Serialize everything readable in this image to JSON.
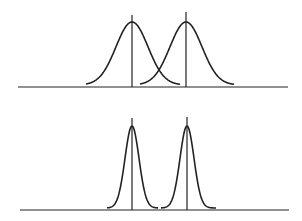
{
  "diagram": {
    "panels": [
      {
        "name": "top",
        "label": "",
        "baseline_y": 87,
        "axis_x": [
          18,
          288
        ],
        "curves": [
          {
            "mean_x": 132,
            "peak_y": 22,
            "sigma_px": 16,
            "span": [
              86,
              180
            ],
            "mean_line_top": 15
          },
          {
            "mean_x": 186,
            "peak_y": 22,
            "sigma_px": 16,
            "span": [
              140,
              234
            ],
            "mean_line_top": 12
          }
        ]
      },
      {
        "name": "bottom",
        "label": "",
        "baseline_y": 210,
        "axis_x": [
          20,
          289
        ],
        "curves": [
          {
            "mean_x": 132,
            "peak_y": 126,
            "sigma_px": 7,
            "span": [
              107,
              158
            ],
            "mean_line_top": 118
          },
          {
            "mean_x": 187,
            "peak_y": 126,
            "sigma_px": 7,
            "span": [
              161,
              216
            ],
            "mean_line_top": 117
          }
        ]
      }
    ],
    "colors": {
      "line": "#222222",
      "background": "#ffffff"
    }
  }
}
